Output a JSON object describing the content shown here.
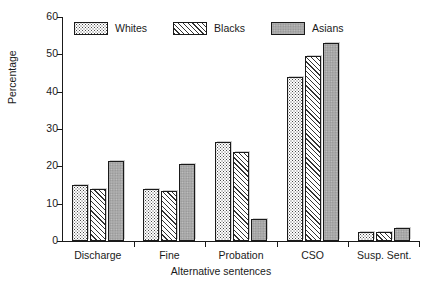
{
  "chart_data": {
    "type": "bar",
    "title": "",
    "xlabel": "Alternative sentences",
    "ylabel": "Percentage",
    "ylim": [
      0,
      60
    ],
    "yticks": [
      0,
      10,
      20,
      30,
      40,
      50,
      60
    ],
    "grid": false,
    "legend_position": "top-left",
    "categories": [
      "Discharge",
      "Fine",
      "Probation",
      "CSO",
      "Susp. Sent."
    ],
    "series": [
      {
        "name": "Whites",
        "pattern": "dotted",
        "values": [
          15,
          14,
          26.5,
          44,
          2.5
        ]
      },
      {
        "name": "Blacks",
        "pattern": "diagonal-hatch",
        "values": [
          14,
          13.5,
          23.8,
          49.5,
          2.5
        ]
      },
      {
        "name": "Asians",
        "pattern": "solid-gray",
        "values": [
          21.5,
          20.5,
          6,
          53,
          3.5
        ]
      }
    ]
  },
  "axes": {
    "y_title": "Percentage",
    "x_title": "Alternative sentences",
    "y_tick_labels": [
      "0",
      "10",
      "20",
      "30",
      "40",
      "50",
      "60"
    ],
    "x_tick_labels": [
      "Discharge",
      "Fine",
      "Probation",
      "CSO",
      "Susp. Sent."
    ]
  },
  "legend": {
    "items": [
      {
        "label": "Whites"
      },
      {
        "label": "Blacks"
      },
      {
        "label": "Asians"
      }
    ]
  },
  "colors": {
    "axis": "#1a1a1a",
    "text": "#1a1a1a",
    "background": "#ffffff",
    "asians_fill": "#a8a8a8",
    "hatch_stroke": "#333333",
    "dot_fill": "#4a4a4a"
  }
}
